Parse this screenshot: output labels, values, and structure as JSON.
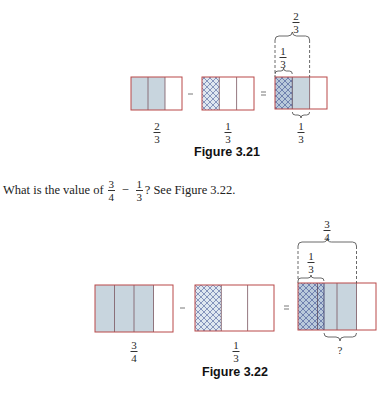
{
  "figure_3_21": {
    "caption": "Figure 3.21",
    "left_fraction": {
      "num": "2",
      "den": "3"
    },
    "operator_minus": "−",
    "middle_fraction": {
      "num": "1",
      "den": "3"
    },
    "operator_equals": "=",
    "result_fraction": {
      "num": "1",
      "den": "3"
    },
    "top_brace_label": {
      "num": "2",
      "den": "3"
    },
    "inner_brace_label": {
      "num": "1",
      "den": "3"
    }
  },
  "question": {
    "prefix": "What is the value of",
    "frac_a": {
      "num": "3",
      "den": "4"
    },
    "minus": "−",
    "frac_b": {
      "num": "1",
      "den": "3"
    },
    "suffix": "? See Figure 3.22."
  },
  "figure_3_22": {
    "caption": "Figure 3.22",
    "left_fraction": {
      "num": "3",
      "den": "4"
    },
    "operator_minus": "−",
    "middle_fraction": {
      "num": "1",
      "den": "3"
    },
    "operator_equals": "=",
    "result_label": "?",
    "top_brace_label": {
      "num": "3",
      "den": "4"
    },
    "inner_brace_label": {
      "num": "1",
      "den": "3"
    }
  },
  "colors": {
    "border": "#b94848",
    "shade": "#c8d5de",
    "hatch": "#6f7fae",
    "divider": "#7a5560"
  }
}
